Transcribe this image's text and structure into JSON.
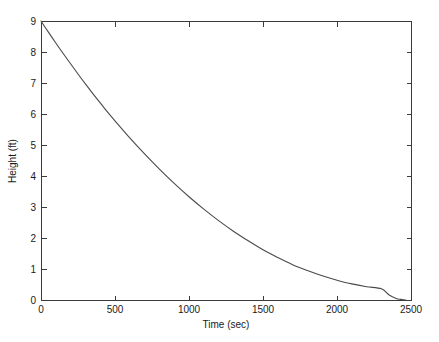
{
  "figure": {
    "background_color": "#ffffff",
    "axis_color": "#3b3b3b",
    "text_color": "#1a1a1a"
  },
  "chart_data": {
    "type": "line",
    "title": "",
    "xlabel": "Time (sec)",
    "ylabel": "Height (ft)",
    "xlim": [
      0,
      2500
    ],
    "ylim": [
      0,
      9
    ],
    "grid": false,
    "legend": null,
    "line_color": "#4a4a4a",
    "xticks": [
      0,
      500,
      1000,
      1500,
      2000,
      2500
    ],
    "xticklabels": [
      "0",
      "500",
      "1000",
      "1500",
      "2000",
      "2500"
    ],
    "yticks": [
      0,
      1,
      2,
      3,
      4,
      5,
      6,
      7,
      8,
      9
    ],
    "yticklabels": [
      "0",
      "1",
      "2",
      "3",
      "4",
      "5",
      "6",
      "7",
      "8",
      "9"
    ],
    "series": [
      {
        "name": "Height",
        "x": [
          0,
          50,
          100,
          150,
          200,
          250,
          300,
          350,
          400,
          450,
          500,
          600,
          700,
          800,
          900,
          1000,
          1100,
          1200,
          1300,
          1400,
          1500,
          1600,
          1700,
          1800,
          1900,
          2000,
          2100,
          2200,
          2300,
          2350,
          2400,
          2430,
          2450,
          2465
        ],
        "y": [
          9.0,
          8.64,
          8.29,
          7.95,
          7.62,
          7.29,
          6.97,
          6.66,
          6.36,
          6.06,
          5.78,
          5.23,
          4.71,
          4.22,
          3.76,
          3.33,
          2.93,
          2.56,
          2.22,
          1.91,
          1.62,
          1.37,
          1.14,
          0.95,
          0.78,
          0.64,
          0.52,
          0.43,
          0.36,
          0.17,
          0.05,
          0.02,
          0.005,
          0.0
        ]
      }
    ]
  },
  "axes_geometry": {
    "left_px": 41,
    "right_px": 411,
    "top_px": 21,
    "bottom_px": 300
  }
}
